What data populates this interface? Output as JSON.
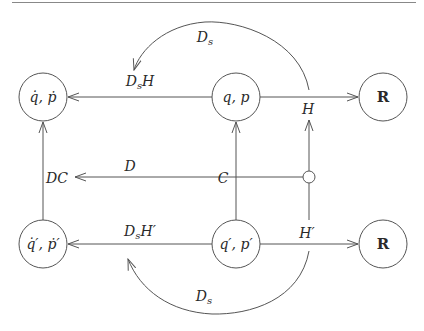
{
  "diagram": {
    "type": "commutative-diagram",
    "nodes": [
      {
        "id": "qdot_pdot",
        "label": "q̇, ṗ",
        "x": 43,
        "y": 97
      },
      {
        "id": "q_p",
        "label": "q, p",
        "x": 236,
        "y": 97
      },
      {
        "id": "R_top",
        "label": "R",
        "x": 383,
        "y": 97
      },
      {
        "id": "qdot_pdot_prime",
        "label": "q̇′, ṗ′",
        "x": 43,
        "y": 244
      },
      {
        "id": "q_p_prime",
        "label": "q′, p′",
        "x": 236,
        "y": 244
      },
      {
        "id": "R_bottom",
        "label": "R",
        "x": 383,
        "y": 244
      }
    ],
    "edges": {
      "ds_top": "D",
      "ds_top_sub": "s",
      "ds_h": "D",
      "ds_h_sub": "s",
      "ds_h_tail": "H",
      "h": "H",
      "dc": "DC",
      "d": "D",
      "c": "C",
      "ds_hprime": "D",
      "ds_hprime_sub": "s",
      "ds_hprime_tail": "H′",
      "hprime": "H′",
      "ds_bottom": "D",
      "ds_bottom_sub": "s"
    },
    "colors": {
      "stroke": "#555555",
      "text": "#2a2a2a",
      "rule": "#888888"
    }
  }
}
